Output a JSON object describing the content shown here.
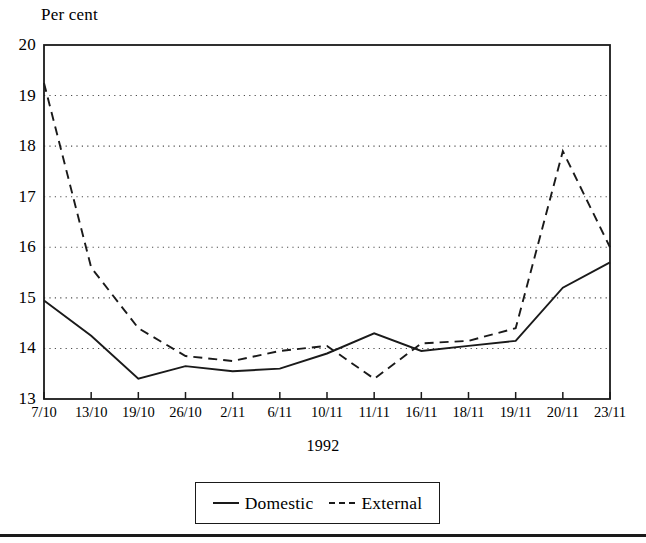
{
  "chart_data": {
    "type": "line",
    "title": "",
    "subtitle": "",
    "ylabel": "Per cent",
    "xlabel": "1992",
    "categories": [
      "7/10",
      "13/10",
      "19/10",
      "26/10",
      "2/11",
      "6/11",
      "10/11",
      "11/11",
      "16/11",
      "18/11",
      "19/11",
      "20/11",
      "23/11"
    ],
    "ylim": [
      13,
      20
    ],
    "yticks": [
      13,
      14,
      15,
      16,
      17,
      18,
      19,
      20
    ],
    "ytick_labels": [
      "13",
      "14",
      "15",
      "16",
      "17",
      "18",
      "19",
      "20"
    ],
    "grid": "horizontal-dotted",
    "legend_position": "below-axes-center",
    "series": [
      {
        "name": "Domestic",
        "style": "solid",
        "color": "#1a1a1a",
        "values": [
          14.95,
          14.25,
          13.4,
          13.65,
          13.55,
          13.6,
          13.9,
          14.3,
          13.95,
          14.05,
          14.15,
          15.2,
          15.7
        ]
      },
      {
        "name": "External",
        "style": "dashed",
        "color": "#1a1a1a",
        "values": [
          19.25,
          15.6,
          14.4,
          13.85,
          13.75,
          13.95,
          14.05,
          13.4,
          14.1,
          14.15,
          14.4,
          17.9,
          16.0
        ]
      }
    ]
  },
  "legend": {
    "entries": [
      {
        "label": "Domestic",
        "marker": "solid-line-icon"
      },
      {
        "label": "External",
        "marker": "dashed-line-icon"
      }
    ]
  },
  "colors": {
    "ink": "#1a1a1a",
    "grid": "#4d4d4d",
    "background": "#ffffff"
  }
}
